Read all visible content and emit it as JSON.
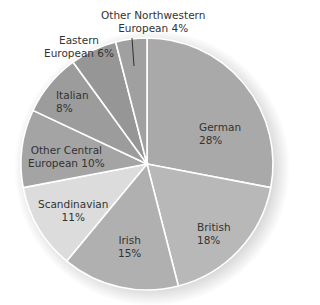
{
  "chart_data": {
    "type": "pie",
    "title": "",
    "start_angle": "12 o'clock",
    "direction": "clockwise",
    "slices": [
      {
        "label": "German",
        "value": 28,
        "text": "28%",
        "color": "#a9a9a9"
      },
      {
        "label": "British",
        "value": 18,
        "text": "18%",
        "color": "#b8b8b8"
      },
      {
        "label": "Irish",
        "value": 15,
        "text": "15%",
        "color": "#b0b0b0"
      },
      {
        "label": "Scandinavian",
        "value": 11,
        "text": "11%",
        "color": "#dcdcdc"
      },
      {
        "label": "Other Central European",
        "value": 10,
        "text": "10%",
        "color": "#a4a4a4"
      },
      {
        "label": "Italian",
        "value": 8,
        "text": "8%",
        "color": "#9c9c9c"
      },
      {
        "label": "Eastern European",
        "value": 6,
        "text": "6%",
        "color": "#969696"
      },
      {
        "label": "Other Northwestern European",
        "value": 4,
        "text": "4%",
        "color": "#a0a0a0"
      }
    ],
    "labels": {
      "german": {
        "line1": "German",
        "line2": "28%"
      },
      "british": {
        "line1": "British",
        "line2": "18%"
      },
      "irish": {
        "line1": "Irish",
        "line2": "15%"
      },
      "scandinavian": {
        "line1": "Scandinavian",
        "line2": "11%"
      },
      "other_central": {
        "line1": "Other Central",
        "line2": "European 10%"
      },
      "italian": {
        "line1": "Italian",
        "line2": "8%"
      },
      "eastern": {
        "line1": "Eastern",
        "line2": "European 6%"
      },
      "other_northwestern": {
        "line1": "Other Northwestern",
        "line2": "European 4%"
      }
    },
    "legend": "none",
    "grid": false
  }
}
